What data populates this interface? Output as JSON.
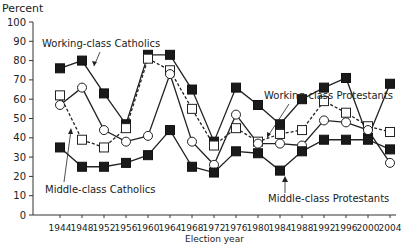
{
  "chart_data": {
    "type": "line",
    "title": "",
    "ylabel": "Percent",
    "xlabel": "Election year",
    "ylim": [
      0,
      100
    ],
    "yticks": [
      0,
      10,
      20,
      30,
      40,
      50,
      60,
      70,
      80,
      90,
      100
    ],
    "x": [
      1944,
      1948,
      1952,
      1956,
      1960,
      1964,
      1968,
      1972,
      1976,
      1980,
      1984,
      1988,
      1992,
      1996,
      2000,
      2004
    ],
    "grid": false,
    "legend_position": "inline annotations",
    "series": [
      {
        "name": "Working-class Catholics",
        "marker": "filled-square",
        "line": "solid",
        "values": [
          76,
          80,
          63,
          47,
          83,
          83,
          65,
          38,
          66,
          57,
          47,
          60,
          66,
          71,
          40,
          68
        ]
      },
      {
        "name": "Middle-class Catholics",
        "marker": "open-square",
        "line": "dashed",
        "values": [
          62,
          39,
          35,
          45,
          81,
          75,
          55,
          36,
          45,
          38,
          42,
          44,
          59,
          53,
          46,
          43
        ]
      },
      {
        "name": "Working-class Protestants",
        "marker": "open-circle",
        "line": "solid",
        "values": [
          57,
          66,
          44,
          38,
          41,
          73,
          38,
          26,
          52,
          37,
          37,
          36,
          49,
          48,
          44,
          27
        ]
      },
      {
        "name": "Middle-class Protestants",
        "marker": "filled-square",
        "line": "solid",
        "values": [
          35,
          25,
          25,
          27,
          31,
          44,
          25,
          22,
          33,
          32,
          23,
          33,
          39,
          39,
          39,
          34
        ]
      }
    ],
    "annotations": [
      {
        "text": "Working-class Catholics",
        "series": 0
      },
      {
        "text": "Middle-class Catholics",
        "series": 1
      },
      {
        "text": "Working-class Protestants",
        "series": 2
      },
      {
        "text": "Middle-class Protestants",
        "series": 3
      }
    ]
  },
  "labels": {
    "y_axis_title": "Percent",
    "x_axis_title": "Election year",
    "annot_wc_cath": "Working-class Catholics",
    "annot_mc_cath": "Middle-class Catholics",
    "annot_wc_prot": "Working-class Protestants",
    "annot_mc_prot": "Middle-class Protestants"
  }
}
